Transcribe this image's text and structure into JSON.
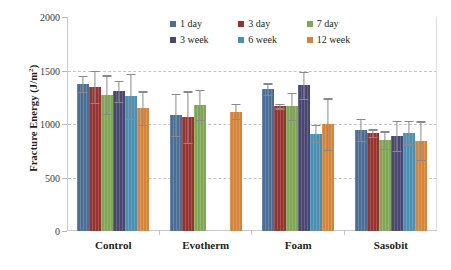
{
  "chart_data": {
    "type": "bar",
    "title": "",
    "xlabel": "",
    "ylabel_text": "Fracture Energy (J/m",
    "ylabel_sup": "2",
    "ylabel_tail": ")",
    "ylabel_full": "Fracture Energy (J/m2)",
    "ylim": [
      0,
      2000
    ],
    "yticks": [
      0,
      500,
      1000,
      1500,
      2000
    ],
    "ytick_labels": [
      "0",
      "500",
      "1000",
      "1500",
      "2000"
    ],
    "grid": "horizontal-dashed",
    "legend_position": "top-center",
    "categories": [
      "Control",
      "Evotherm",
      "Foam",
      "Sasobit"
    ],
    "series": [
      {
        "name": "1 day",
        "color": "#4a6e96",
        "values": [
          1375,
          1085,
          1325,
          945
        ],
        "errors": [
          75,
          195,
          55,
          100
        ]
      },
      {
        "name": "3 day",
        "color": "#963230",
        "values": [
          1345,
          1065,
          1165,
          915
        ],
        "errors": [
          150,
          240,
          20,
          35
        ]
      },
      {
        "name": "7 day",
        "color": "#7fa855",
        "values": [
          1275,
          1180,
          1165,
          850
        ],
        "errors": [
          180,
          140,
          125,
          80
        ]
      },
      {
        "name": "3 week",
        "color": "#4a4672",
        "values": [
          1305,
          null,
          1360,
          890
        ],
        "errors": [
          95,
          null,
          125,
          140
        ]
      },
      {
        "name": "6 week",
        "color": "#4a8fb4",
        "values": [
          1260,
          null,
          910,
          920
        ],
        "errors": [
          210,
          null,
          80,
          110
        ]
      },
      {
        "name": "12 week",
        "color": "#d88438",
        "values": [
          1150,
          1115,
          1000,
          845
        ],
        "errors": [
          155,
          70,
          240,
          180
        ]
      }
    ]
  },
  "legend": {
    "items": [
      {
        "label": "1 day",
        "color": "#4a6e96"
      },
      {
        "label": "3 day",
        "color": "#963230"
      },
      {
        "label": "7 day",
        "color": "#7fa855"
      },
      {
        "label": "3 week",
        "color": "#4a4672"
      },
      {
        "label": "6 week",
        "color": "#4a8fb4"
      },
      {
        "label": "12 week",
        "color": "#d88438"
      }
    ]
  }
}
